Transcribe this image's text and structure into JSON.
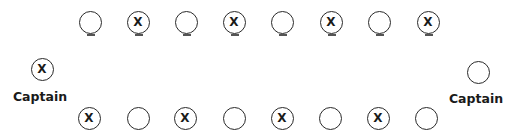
{
  "diagram": {
    "colors": {
      "stroke": "#2a2a2a",
      "text": "#1a1a1a",
      "background": "#ffffff"
    },
    "top_row": [
      {
        "mark": ""
      },
      {
        "mark": "X"
      },
      {
        "mark": ""
      },
      {
        "mark": "X"
      },
      {
        "mark": ""
      },
      {
        "mark": "X"
      },
      {
        "mark": ""
      },
      {
        "mark": "X"
      }
    ],
    "bottom_row": [
      {
        "mark": "X"
      },
      {
        "mark": ""
      },
      {
        "mark": "X"
      },
      {
        "mark": ""
      },
      {
        "mark": "X"
      },
      {
        "mark": ""
      },
      {
        "mark": "X"
      },
      {
        "mark": ""
      }
    ],
    "left_captain": {
      "mark": "X",
      "label": "Captain"
    },
    "right_captain": {
      "mark": "",
      "label": "Captain"
    }
  }
}
